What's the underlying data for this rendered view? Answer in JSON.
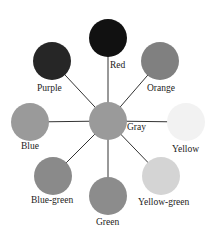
{
  "diagram": {
    "type": "gray-value color wheel",
    "center": {
      "label": "Gray",
      "color": "#9a9a9a",
      "x": 108,
      "y": 121,
      "r": 19
    },
    "nodes": [
      {
        "label": "Red",
        "color": "#111111",
        "x": 108,
        "y": 38,
        "r": 19
      },
      {
        "label": "Orange",
        "color": "#808080",
        "x": 160,
        "y": 61,
        "r": 19
      },
      {
        "label": "Yellow",
        "color": "#f2f2f2",
        "x": 186,
        "y": 122,
        "r": 19
      },
      {
        "label": "Yellow-green",
        "color": "#d4d4d4",
        "x": 161,
        "y": 176,
        "r": 19
      },
      {
        "label": "Green",
        "color": "#8c8c8c",
        "x": 108,
        "y": 196,
        "r": 19
      },
      {
        "label": "Blue-green",
        "color": "#8a8a8a",
        "x": 53,
        "y": 176,
        "r": 19
      },
      {
        "label": "Blue",
        "color": "#9a9a9a",
        "x": 30,
        "y": 122,
        "r": 19
      },
      {
        "label": "Purple",
        "color": "#262626",
        "x": 52,
        "y": 61,
        "r": 19
      }
    ],
    "line_color": "#333333"
  },
  "labels": {
    "red": "Red",
    "orange": "Orange",
    "yellow": "Yellow",
    "yellow_green": "Yellow-green",
    "green": "Green",
    "blue_green": "Blue-green",
    "blue": "Blue",
    "purple": "Purple",
    "gray": "Gray"
  }
}
